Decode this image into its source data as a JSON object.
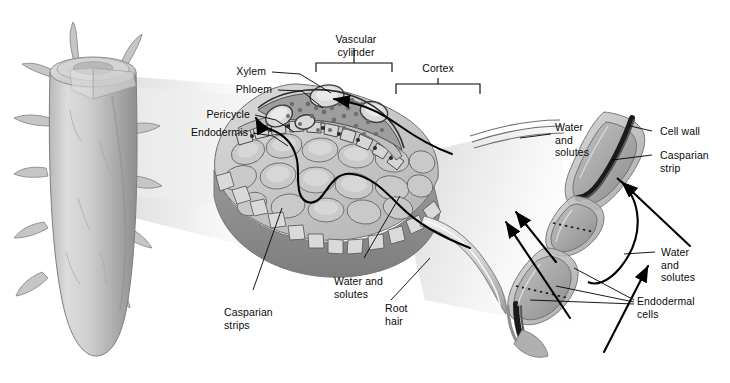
{
  "figure": {
    "background_color": "#ffffff",
    "text_color": "#0a0a0a",
    "beam_color": "#e8e8e8"
  },
  "labels": {
    "vascular_cylinder": "Vascular\ncylinder",
    "cortex": "Cortex",
    "xylem": "Xylem",
    "phloem": "Phloem",
    "pericycle": "Pericycle",
    "endodermis": "Endodermis",
    "casparian_strips": "Casparian\nstrips",
    "water_and_solutes_center": "Water and\nsolutes",
    "root_hair": "Root\nhair",
    "water_and_solutes_upper_right": "Water\nand\nsolutes",
    "cell_wall": "Cell wall",
    "casparian_strip": "Casparian\nstrip",
    "water_and_solutes_lower_right": "Water\nand\nsolutes",
    "endodermal_cells": "Endodermal\ncells"
  },
  "panels": [
    {
      "name": "root-overview",
      "description": "Whole root tip with lateral root hairs and a cut-away wedge removed from the upper region"
    },
    {
      "name": "root-cross-section-wedge",
      "description": "Magnified pie-wedge of root showing vascular cylinder, cortex, endodermis and root hair"
    },
    {
      "name": "endodermal-cell-detail",
      "description": "Magnified chain of endodermal cells showing Casparian strip blocking the cell wall route"
    }
  ],
  "icons": {
    "arrow": "arrow-icon",
    "bracket": "bracket-icon",
    "leader": "leader-line-icon"
  }
}
